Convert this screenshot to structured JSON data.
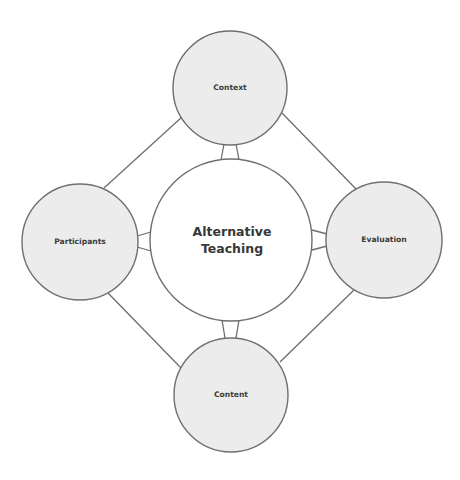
{
  "diagram": {
    "center": {
      "line1": "Alternative",
      "line2": "Teaching"
    },
    "nodes": {
      "top": {
        "label": "Context"
      },
      "left": {
        "label": "Participants"
      },
      "right": {
        "label": "Evaluation"
      },
      "bottom": {
        "label": "Content"
      }
    },
    "colors": {
      "outer_fill": "#ececec",
      "center_fill": "#ffffff",
      "stroke": "#6f6f6f",
      "text": "#3c3c3c"
    }
  }
}
